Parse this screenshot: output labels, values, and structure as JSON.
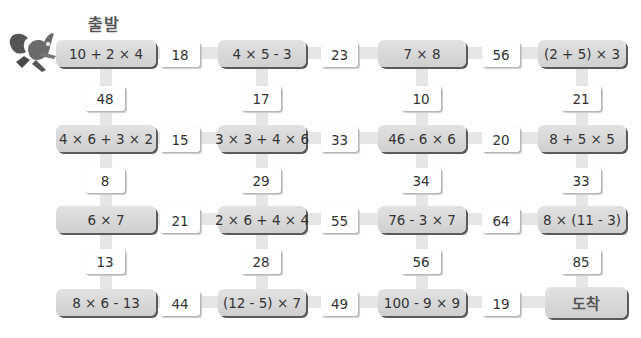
{
  "title": "출발",
  "goal_label": "도착",
  "character": "squirrel-icon",
  "grid": [
    [
      "10 + 2 × 4",
      "4 × 5 - 3",
      "7 × 8",
      "(2 + 5) × 3"
    ],
    [
      "4 × 6 + 3 × 2",
      "3 × 3 + 4 × 6",
      "46 - 6 × 6",
      "8 + 5 × 5"
    ],
    [
      "6 × 7",
      "2 × 6 + 4 × 4",
      "76 - 3 × 7",
      "8 × (11 - 3)"
    ],
    [
      "8 × 6 - 13",
      "(12 - 5) × 7",
      "100 - 9 × 9",
      "도착"
    ]
  ],
  "horizontal_answers": [
    [
      "18",
      "23",
      "56"
    ],
    [
      "15",
      "33",
      "20"
    ],
    [
      "21",
      "55",
      "64"
    ],
    [
      "44",
      "49",
      "19"
    ]
  ],
  "vertical_answers": [
    [
      "48",
      "17",
      "10",
      "21"
    ],
    [
      "8",
      "29",
      "34",
      "33"
    ],
    [
      "13",
      "28",
      "56",
      "85"
    ]
  ]
}
